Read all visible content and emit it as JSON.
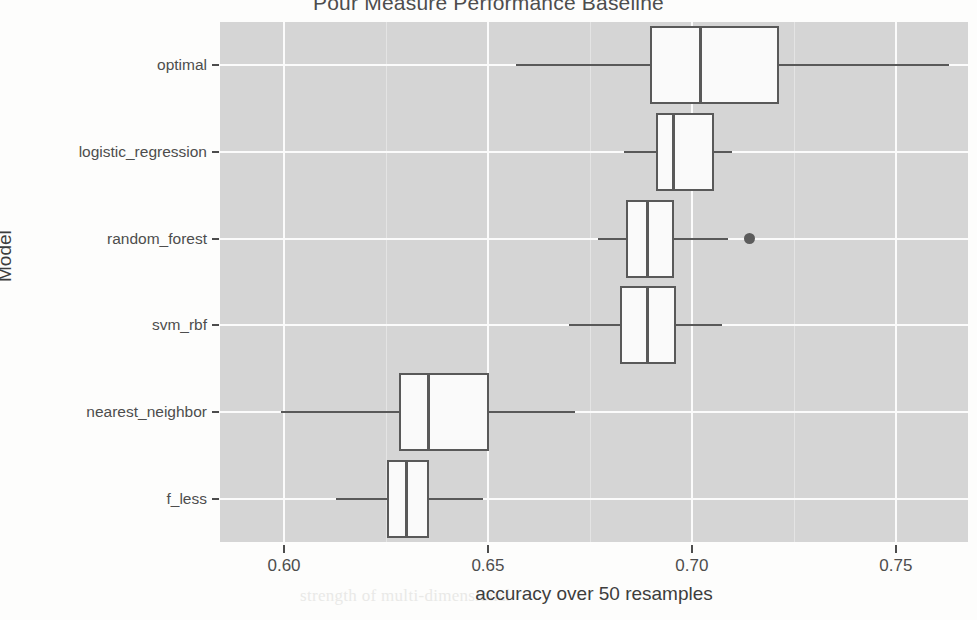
{
  "chart_data": {
    "type": "boxplot",
    "title": "Pour Measure Performance Baseline",
    "xlabel": "accuracy over 50 resamples",
    "ylabel": "Model",
    "xlim": [
      0.5843,
      0.7677
    ],
    "xticks": [
      0.6,
      0.65,
      0.7,
      0.75
    ],
    "xtick_labels": [
      "0.60",
      "0.65",
      "0.70",
      "0.75"
    ],
    "grid": "major-and-minor-vertical",
    "legend": "none",
    "orientation": "horizontal",
    "categories": [
      "optimal",
      "logistic_regression",
      "random_forest",
      "svm_rbf",
      "nearest_neighbor",
      "f_less"
    ],
    "boxes": [
      {
        "category": "optimal",
        "whisker_low": 0.6568,
        "q1": 0.6897,
        "median": 0.7022,
        "q3": 0.7213,
        "whisker_high": 0.763,
        "outliers": []
      },
      {
        "category": "logistic_regression",
        "whisker_low": 0.6833,
        "q1": 0.6912,
        "median": 0.6956,
        "q3": 0.7054,
        "whisker_high": 0.7098,
        "outliers": []
      },
      {
        "category": "random_forest",
        "whisker_low": 0.677,
        "q1": 0.6838,
        "median": 0.6892,
        "q3": 0.6956,
        "whisker_high": 0.7088,
        "outliers": [
          0.7142
        ]
      },
      {
        "category": "svm_rbf",
        "whisker_low": 0.6699,
        "q1": 0.6824,
        "median": 0.6892,
        "q3": 0.696,
        "whisker_high": 0.7073,
        "outliers": []
      },
      {
        "category": "nearest_neighbor",
        "whisker_low": 0.5993,
        "q1": 0.6282,
        "median": 0.6355,
        "q3": 0.6503,
        "whisker_high": 0.6714,
        "outliers": []
      },
      {
        "category": "f_less",
        "whisker_low": 0.6128,
        "q1": 0.6252,
        "median": 0.6301,
        "q3": 0.6355,
        "whisker_high": 0.6488,
        "outliers": []
      }
    ]
  },
  "axes": {
    "x_title": "accuracy over 50 resamples",
    "y_title": "Model",
    "x_tick_labels": [
      "0.60",
      "0.65",
      "0.70",
      "0.75"
    ],
    "y_tick_labels": [
      "optimal",
      "logistic_regression",
      "random_forest",
      "svm_rbf",
      "nearest_neighbor",
      "f_less"
    ]
  },
  "title": "Pour Measure Performance Baseline",
  "colors": {
    "panel_background": "#d5d5d5",
    "major_gridline": "#fbfbfb",
    "minor_gridline": "#e4e4e4",
    "box_fill": "#fafafa",
    "box_stroke": "#595959",
    "outlier": "#5c5c5c",
    "text": "#4d4d4d"
  },
  "background_text": {
    "line1": "is less as possible",
    "line2": "results, we use the",
    "line3": "not performance a",
    "line4": "uch of B encode-",
    "line5": "relations only display are",
    "line6": "strength of multi-dimensional"
  }
}
